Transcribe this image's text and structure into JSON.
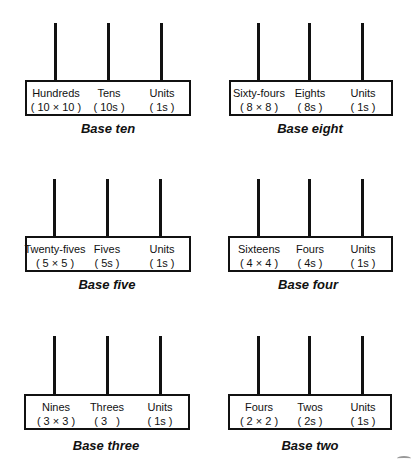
{
  "panels": [
    {
      "title": "Base ten",
      "columns": [
        {
          "name": "Hundreds",
          "value": "( 10 × 10 )"
        },
        {
          "name": "Tens",
          "value": "( 10s )"
        },
        {
          "name": "Units",
          "value": "( 1s )"
        }
      ]
    },
    {
      "title": "Base eight",
      "columns": [
        {
          "name": "Sixty-fours",
          "value": "( 8 × 8 )"
        },
        {
          "name": "Eights",
          "value": "( 8s )"
        },
        {
          "name": "Units",
          "value": "( 1s )"
        }
      ]
    },
    {
      "title": "Base five",
      "columns": [
        {
          "name": "Twenty-fives",
          "value": "( 5 × 5 )"
        },
        {
          "name": "Fives",
          "value": "( 5s )"
        },
        {
          "name": "Units",
          "value": "( 1s )"
        }
      ]
    },
    {
      "title": "Base four",
      "columns": [
        {
          "name": "Sixteens",
          "value": "( 4 × 4 )"
        },
        {
          "name": "Fours",
          "value": "( 4s )"
        },
        {
          "name": "Units",
          "value": "( 1s )"
        }
      ]
    },
    {
      "title": "Base three",
      "columns": [
        {
          "name": "Nines",
          "value": "( 3 × 3 )"
        },
        {
          "name": "Threes",
          "value": "( 3   )"
        },
        {
          "name": "Units",
          "value": "( 1s )"
        }
      ]
    },
    {
      "title": "Base two",
      "columns": [
        {
          "name": "Fours",
          "value": "( 2 × 2 )"
        },
        {
          "name": "Twos",
          "value": "( 2s )"
        },
        {
          "name": "Units",
          "value": "( 1s )"
        }
      ]
    }
  ]
}
